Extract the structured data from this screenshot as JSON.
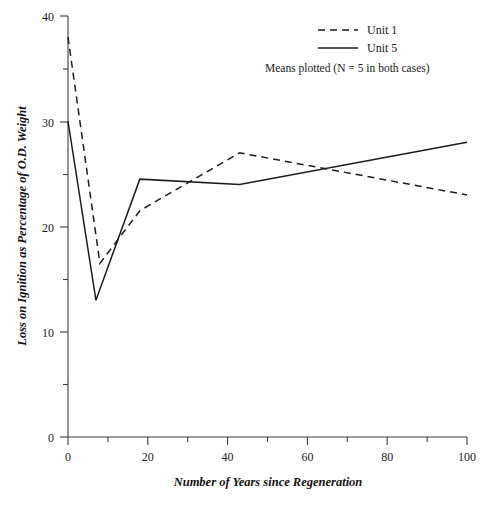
{
  "chart_data": {
    "type": "line",
    "title": "",
    "xlabel": "Number of Years since Regeneration",
    "ylabel": "Loss on Ignition as Percentage of O.D. Weight",
    "xlim": [
      0,
      100
    ],
    "ylim": [
      0,
      40
    ],
    "x_ticks": [
      0,
      20,
      40,
      60,
      80,
      100
    ],
    "x_tick_labels": [
      "0",
      "20",
      "40",
      "60",
      "80",
      "100"
    ],
    "x_minor_ticks": [
      10,
      30,
      50,
      70,
      90
    ],
    "y_ticks": [
      0,
      10,
      20,
      30,
      40
    ],
    "y_tick_labels": [
      "0",
      "10",
      "20",
      "30",
      "40"
    ],
    "y_minor_ticks": [
      5,
      15,
      25,
      35
    ],
    "grid": false,
    "legend_position": "top-right",
    "annotation": "Means plotted (N = 5 in both cases)",
    "series": [
      {
        "name": "Unit 1",
        "style": "dashed",
        "color": "#1c1c1c",
        "x": [
          0,
          8,
          18,
          43,
          100
        ],
        "values": [
          38.0,
          16.5,
          21.5,
          27.0,
          23.0
        ]
      },
      {
        "name": "Unit 5",
        "style": "solid",
        "color": "#1c1c1c",
        "x": [
          0,
          7,
          18,
          43,
          100
        ],
        "values": [
          30.0,
          13.0,
          24.5,
          24.0,
          28.0
        ]
      }
    ]
  },
  "legend": {
    "items": [
      {
        "label": "Unit 1",
        "style": "dashed"
      },
      {
        "label": "Unit 5",
        "style": "solid"
      }
    ],
    "note": "Means plotted (N = 5 in both cases)"
  },
  "axes": {
    "x_title": "Number of Years since Regeneration",
    "y_title": "Loss on Ignition as Percentage of O.D. Weight",
    "x_labels": [
      "0",
      "20",
      "40",
      "60",
      "80",
      "100"
    ],
    "y_labels": [
      "0",
      "10",
      "20",
      "30",
      "40"
    ]
  }
}
